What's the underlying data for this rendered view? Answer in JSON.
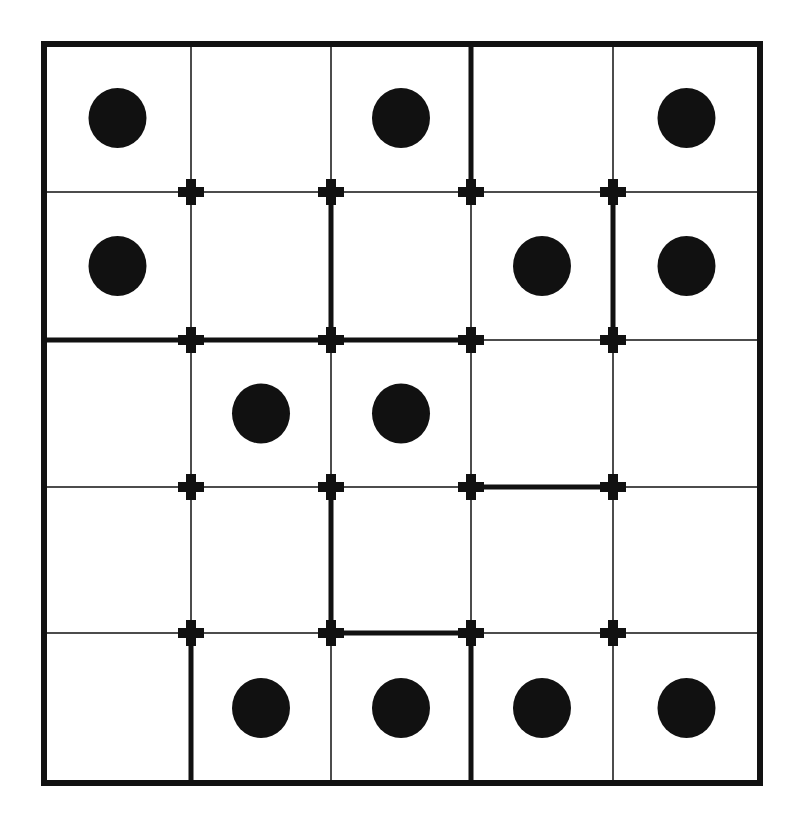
{
  "puzzle": {
    "rows": 5,
    "cols": 5,
    "colors": {
      "background": "#ffffff",
      "ink": "#111111"
    },
    "x_lines": [
      44,
      191,
      331,
      471,
      613,
      760
    ],
    "y_lines": [
      44,
      192,
      340,
      487,
      633,
      783
    ],
    "outer_border_width": 6,
    "thin_line_width": 1.5,
    "thick_line_width": 5,
    "dot_rx": 29,
    "dot_ry": 30,
    "dots": [
      {
        "row": 0,
        "col": 0
      },
      {
        "row": 0,
        "col": 2
      },
      {
        "row": 0,
        "col": 4
      },
      {
        "row": 1,
        "col": 0
      },
      {
        "row": 1,
        "col": 3
      },
      {
        "row": 1,
        "col": 4
      },
      {
        "row": 2,
        "col": 1
      },
      {
        "row": 2,
        "col": 2
      },
      {
        "row": 4,
        "col": 1
      },
      {
        "row": 4,
        "col": 2
      },
      {
        "row": 4,
        "col": 3
      },
      {
        "row": 4,
        "col": 4
      }
    ],
    "thick_edges": [
      {
        "type": "v",
        "line": 3,
        "from": 0,
        "to": 1
      },
      {
        "type": "v",
        "line": 2,
        "from": 1,
        "to": 2
      },
      {
        "type": "v",
        "line": 4,
        "from": 1,
        "to": 2
      },
      {
        "type": "h",
        "line": 2,
        "from": 0,
        "to": 3
      },
      {
        "type": "h",
        "line": 3,
        "from": 3,
        "to": 4
      },
      {
        "type": "v",
        "line": 2,
        "from": 3,
        "to": 4
      },
      {
        "type": "h",
        "line": 4,
        "from": 2,
        "to": 3
      },
      {
        "type": "v",
        "line": 1,
        "from": 4,
        "to": 5
      },
      {
        "type": "v",
        "line": 3,
        "from": 4,
        "to": 5
      }
    ],
    "cross_size": 26,
    "cross_thickness": 10
  }
}
